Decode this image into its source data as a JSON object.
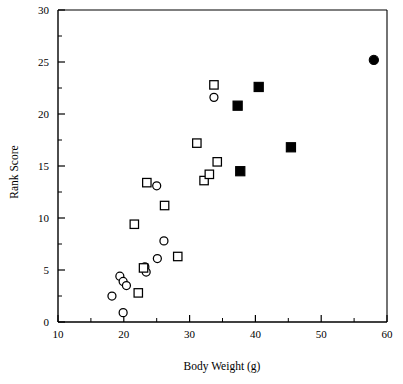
{
  "chart_data": {
    "type": "scatter",
    "title": "",
    "xlabel": "Body Weight (g)",
    "ylabel": "Rank Score",
    "xlim": [
      10,
      60
    ],
    "ylim": [
      0,
      30
    ],
    "xticks": [
      10,
      20,
      30,
      40,
      50,
      60
    ],
    "yticks": [
      0,
      5,
      10,
      15,
      20,
      25,
      30
    ],
    "xtick_labels": [
      "10",
      "20",
      "30",
      "40",
      "50",
      "60"
    ],
    "ytick_labels": [
      "0",
      "5",
      "10",
      "15",
      "20",
      "25",
      "30"
    ],
    "x_minor_ticks": [
      15,
      25,
      35,
      45,
      55
    ],
    "y_minor_ticks": [
      2.5,
      7.5,
      12.5,
      17.5,
      22.5,
      27.5
    ],
    "grid": false,
    "legend": "none",
    "frame": "left-bottom",
    "series": [
      {
        "name": "open-circle",
        "marker": "circle",
        "fill": "open",
        "color": "#000000",
        "points": [
          {
            "x": 18.2,
            "y": 2.5
          },
          {
            "x": 19.9,
            "y": 0.9
          },
          {
            "x": 19.4,
            "y": 4.4
          },
          {
            "x": 19.9,
            "y": 3.9
          },
          {
            "x": 20.4,
            "y": 3.5
          },
          {
            "x": 23.2,
            "y": 5.3
          },
          {
            "x": 23.4,
            "y": 4.8
          },
          {
            "x": 25.1,
            "y": 6.1
          },
          {
            "x": 26.1,
            "y": 7.8
          },
          {
            "x": 25.0,
            "y": 13.1
          },
          {
            "x": 33.7,
            "y": 21.6
          }
        ]
      },
      {
        "name": "open-square",
        "marker": "square",
        "fill": "open",
        "color": "#000000",
        "points": [
          {
            "x": 22.2,
            "y": 2.8
          },
          {
            "x": 23.0,
            "y": 5.2
          },
          {
            "x": 21.6,
            "y": 9.4
          },
          {
            "x": 28.2,
            "y": 6.3
          },
          {
            "x": 26.2,
            "y": 11.2
          },
          {
            "x": 23.5,
            "y": 13.4
          },
          {
            "x": 32.2,
            "y": 13.6
          },
          {
            "x": 33.0,
            "y": 14.2
          },
          {
            "x": 34.2,
            "y": 15.4
          },
          {
            "x": 31.1,
            "y": 17.2
          },
          {
            "x": 33.7,
            "y": 22.8
          }
        ]
      },
      {
        "name": "filled-square",
        "marker": "square",
        "fill": "filled",
        "color": "#000000",
        "points": [
          {
            "x": 37.7,
            "y": 14.5
          },
          {
            "x": 45.4,
            "y": 16.8
          },
          {
            "x": 37.3,
            "y": 20.8
          },
          {
            "x": 40.5,
            "y": 22.6
          }
        ]
      },
      {
        "name": "filled-circle",
        "marker": "circle",
        "fill": "filled",
        "color": "#000000",
        "points": [
          {
            "x": 58.0,
            "y": 25.2
          }
        ]
      }
    ]
  }
}
